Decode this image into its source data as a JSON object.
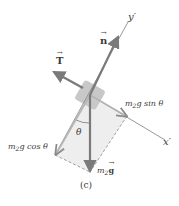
{
  "figure": {
    "panel_label": "(c)",
    "colors": {
      "force_arrow": "#7a7a7a",
      "axis": "#8c8c8c",
      "block": "#c8c8c8",
      "component_region": "#eeeeee",
      "dashed": "#8a8a8a",
      "text": "#3a3a3a"
    },
    "axes": {
      "x_prime_label": "x′",
      "y_prime_label": "y′"
    },
    "forces": {
      "normal": {
        "symbol": "n",
        "label": "n"
      },
      "tension": {
        "symbol": "T",
        "label": "T"
      },
      "weight": {
        "prefix": "m",
        "subscript": "2",
        "vector": "g"
      }
    },
    "components": {
      "parallel": {
        "prefix": "m",
        "subscript": "2",
        "rest": "g sin θ"
      },
      "perpendicular": {
        "prefix": "m",
        "subscript": "2",
        "rest": "g cos θ"
      }
    },
    "angle": {
      "label": "θ"
    }
  }
}
